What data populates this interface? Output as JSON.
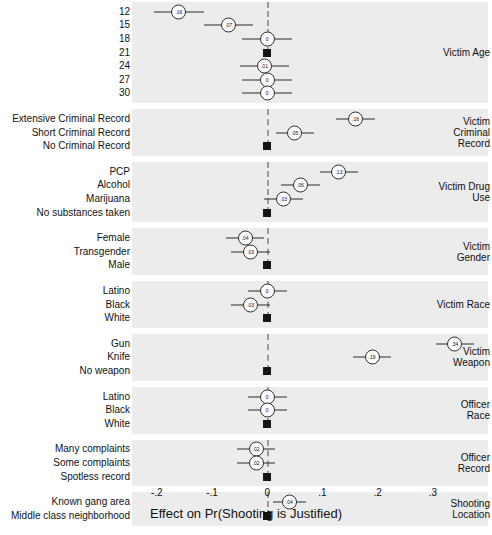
{
  "chart_data": {
    "type": "scatter",
    "title": "",
    "xlabel": "Effect on Pr(Shooting is Justified)",
    "ylabel": "",
    "xlim": [
      -0.245,
      0.4
    ],
    "xticks": [
      -0.2,
      -0.1,
      0,
      0.1,
      0.2,
      0.3
    ],
    "xticklabels": [
      "-.2",
      "-.1",
      "0",
      ".1",
      ".2",
      ".3"
    ],
    "grid": false,
    "reference_line": 0,
    "marker_style": "circle-with-value-label-and-confidence-whiskers",
    "reference_marker_style": "filled-square",
    "groups": [
      {
        "name": "Victim Age",
        "label_lines": [
          "Victim Age"
        ],
        "points": [
          {
            "label": "12",
            "value": -0.16,
            "value_text": ".16",
            "ci_low": -0.205,
            "ci_high": -0.115,
            "is_reference": false
          },
          {
            "label": "15",
            "value": -0.07,
            "value_text": ".07",
            "ci_low": -0.115,
            "ci_high": -0.025,
            "is_reference": false
          },
          {
            "label": "18",
            "value": 0.0,
            "value_text": "0",
            "ci_low": -0.045,
            "ci_high": 0.045,
            "is_reference": false
          },
          {
            "label": "21",
            "value": 0.0,
            "value_text": "",
            "ci_low": 0.0,
            "ci_high": 0.0,
            "is_reference": true
          },
          {
            "label": "24",
            "value": -0.005,
            "value_text": ".01",
            "ci_low": -0.05,
            "ci_high": 0.04,
            "is_reference": false
          },
          {
            "label": "27",
            "value": 0.0,
            "value_text": "0",
            "ci_low": -0.045,
            "ci_high": 0.045,
            "is_reference": false
          },
          {
            "label": "30",
            "value": 0.0,
            "value_text": "0",
            "ci_low": -0.045,
            "ci_high": 0.045,
            "is_reference": false
          }
        ]
      },
      {
        "name": "Victim Criminal Record",
        "label_lines": [
          "Victim",
          "Criminal",
          "Record"
        ],
        "points": [
          {
            "label": "Extensive Criminal Record",
            "value": 0.16,
            "value_text": ".16",
            "ci_low": 0.125,
            "ci_high": 0.195,
            "is_reference": false
          },
          {
            "label": "Short Criminal Record",
            "value": 0.05,
            "value_text": ".05",
            "ci_low": 0.015,
            "ci_high": 0.085,
            "is_reference": false
          },
          {
            "label": "No Criminal Record",
            "value": 0.0,
            "value_text": "",
            "ci_low": 0.0,
            "ci_high": 0.0,
            "is_reference": true
          }
        ]
      },
      {
        "name": "Victim Drug Use",
        "label_lines": [
          "Victim Drug",
          "Use"
        ],
        "points": [
          {
            "label": "PCP",
            "value": 0.13,
            "value_text": ".13",
            "ci_low": 0.095,
            "ci_high": 0.165,
            "is_reference": false
          },
          {
            "label": "Alcohol",
            "value": 0.06,
            "value_text": ".06",
            "ci_low": 0.025,
            "ci_high": 0.095,
            "is_reference": false
          },
          {
            "label": "Marijuana",
            "value": 0.03,
            "value_text": ".03",
            "ci_low": -0.005,
            "ci_high": 0.065,
            "is_reference": false
          },
          {
            "label": "No substances taken",
            "value": 0.0,
            "value_text": "",
            "ci_low": 0.0,
            "ci_high": 0.0,
            "is_reference": true
          }
        ]
      },
      {
        "name": "Victim Gender",
        "label_lines": [
          "Victim",
          "Gender"
        ],
        "points": [
          {
            "label": "Female",
            "value": -0.04,
            "value_text": ".04",
            "ci_low": -0.075,
            "ci_high": -0.005,
            "is_reference": false
          },
          {
            "label": "Transgender",
            "value": -0.03,
            "value_text": ".03",
            "ci_low": -0.065,
            "ci_high": 0.005,
            "is_reference": false
          },
          {
            "label": "Male",
            "value": 0.0,
            "value_text": "",
            "ci_low": 0.0,
            "ci_high": 0.0,
            "is_reference": true
          }
        ]
      },
      {
        "name": "Victim Race",
        "label_lines": [
          "Victim Race"
        ],
        "points": [
          {
            "label": "Latino",
            "value": 0.0,
            "value_text": "0",
            "ci_low": -0.035,
            "ci_high": 0.035,
            "is_reference": false
          },
          {
            "label": "Black",
            "value": -0.03,
            "value_text": ".03",
            "ci_low": -0.065,
            "ci_high": 0.005,
            "is_reference": false
          },
          {
            "label": "White",
            "value": 0.0,
            "value_text": "",
            "ci_low": 0.0,
            "ci_high": 0.0,
            "is_reference": true
          }
        ]
      },
      {
        "name": "Victim Weapon",
        "label_lines": [
          "Victim",
          "Weapon"
        ],
        "points": [
          {
            "label": "Gun",
            "value": 0.34,
            "value_text": ".34",
            "ci_low": 0.305,
            "ci_high": 0.375,
            "is_reference": false
          },
          {
            "label": "Knife",
            "value": 0.19,
            "value_text": ".19",
            "ci_low": 0.155,
            "ci_high": 0.225,
            "is_reference": false
          },
          {
            "label": "No weapon",
            "value": 0.0,
            "value_text": "",
            "ci_low": 0.0,
            "ci_high": 0.0,
            "is_reference": true
          }
        ]
      },
      {
        "name": "Officer Race",
        "label_lines": [
          "Officer",
          "Race"
        ],
        "points": [
          {
            "label": "Latino",
            "value": 0.0,
            "value_text": "0",
            "ci_low": -0.035,
            "ci_high": 0.035,
            "is_reference": false
          },
          {
            "label": "Black",
            "value": 0.0,
            "value_text": "0",
            "ci_low": -0.035,
            "ci_high": 0.035,
            "is_reference": false
          },
          {
            "label": "White",
            "value": 0.0,
            "value_text": "",
            "ci_low": 0.0,
            "ci_high": 0.0,
            "is_reference": true
          }
        ]
      },
      {
        "name": "Officer Record",
        "label_lines": [
          "Officer",
          "Record"
        ],
        "points": [
          {
            "label": "Many complaints",
            "value": -0.02,
            "value_text": ".02",
            "ci_low": -0.055,
            "ci_high": 0.015,
            "is_reference": false
          },
          {
            "label": "Some complaints",
            "value": -0.02,
            "value_text": ".02",
            "ci_low": -0.055,
            "ci_high": 0.015,
            "is_reference": false
          },
          {
            "label": "Spotless record",
            "value": 0.0,
            "value_text": "",
            "ci_low": 0.0,
            "ci_high": 0.0,
            "is_reference": true
          }
        ]
      },
      {
        "name": "Shooting Location",
        "label_lines": [
          "Shooting",
          "Location"
        ],
        "points": [
          {
            "label": "Known gang area",
            "value": 0.04,
            "value_text": ".04",
            "ci_low": 0.01,
            "ci_high": 0.07,
            "is_reference": false
          },
          {
            "label": "Middle class neighborhood",
            "value": 0.0,
            "value_text": "",
            "ci_low": 0.0,
            "ci_high": 0.0,
            "is_reference": true
          }
        ]
      }
    ]
  },
  "colors": {
    "panel_background": "#ececec",
    "marker_fill": "#fbfbfb",
    "marker_stroke": "#2f2f2f",
    "reference_marker": "#151515",
    "zero_line": "#9a9a9a",
    "text": "#111111",
    "page_background": "#ffffff"
  }
}
